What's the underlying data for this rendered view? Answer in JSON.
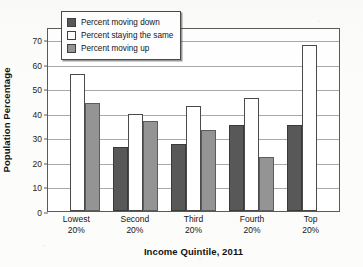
{
  "chart_data": {
    "type": "bar",
    "title": "",
    "xlabel": "Income Quintile, 2011",
    "ylabel": "Population Percentage",
    "ylim": [
      0,
      75
    ],
    "yticks": [
      0,
      10,
      20,
      30,
      40,
      50,
      60,
      70
    ],
    "grid": true,
    "legend_position": "top-left inside plot",
    "categories": [
      "Lowest\n20%",
      "Second\n20%",
      "Third\n20%",
      "Fourth\n20%",
      "Top\n20%"
    ],
    "category_lines": [
      {
        "name": "Lowest",
        "pct": "20%"
      },
      {
        "name": "Second",
        "pct": "20%"
      },
      {
        "name": "Third",
        "pct": "20%"
      },
      {
        "name": "Fourth",
        "pct": "20%"
      },
      {
        "name": "Top",
        "pct": "20%"
      }
    ],
    "series": [
      {
        "name": "Percent moving down",
        "color": "#585858",
        "values": [
          0,
          26,
          27.5,
          35,
          35
        ]
      },
      {
        "name": "Percent staying the same",
        "color": "#ffffff",
        "values": [
          56,
          39.5,
          43,
          46,
          67.5
        ]
      },
      {
        "name": "Percent moving up",
        "color": "#949494",
        "values": [
          44,
          36.5,
          33,
          22,
          0
        ]
      }
    ]
  },
  "legend": {
    "items": [
      {
        "label": "Percent moving down",
        "swatch": "dark-gray"
      },
      {
        "label": "Percent staying the same",
        "swatch": "white"
      },
      {
        "label": "Percent moving up",
        "swatch": "medium-gray"
      }
    ]
  },
  "axes": {
    "y_label": "Population Percentage",
    "x_label": "Income Quintile, 2011",
    "y_ticks": [
      "70",
      "60",
      "50",
      "40",
      "30",
      "20",
      "10",
      "0"
    ]
  }
}
